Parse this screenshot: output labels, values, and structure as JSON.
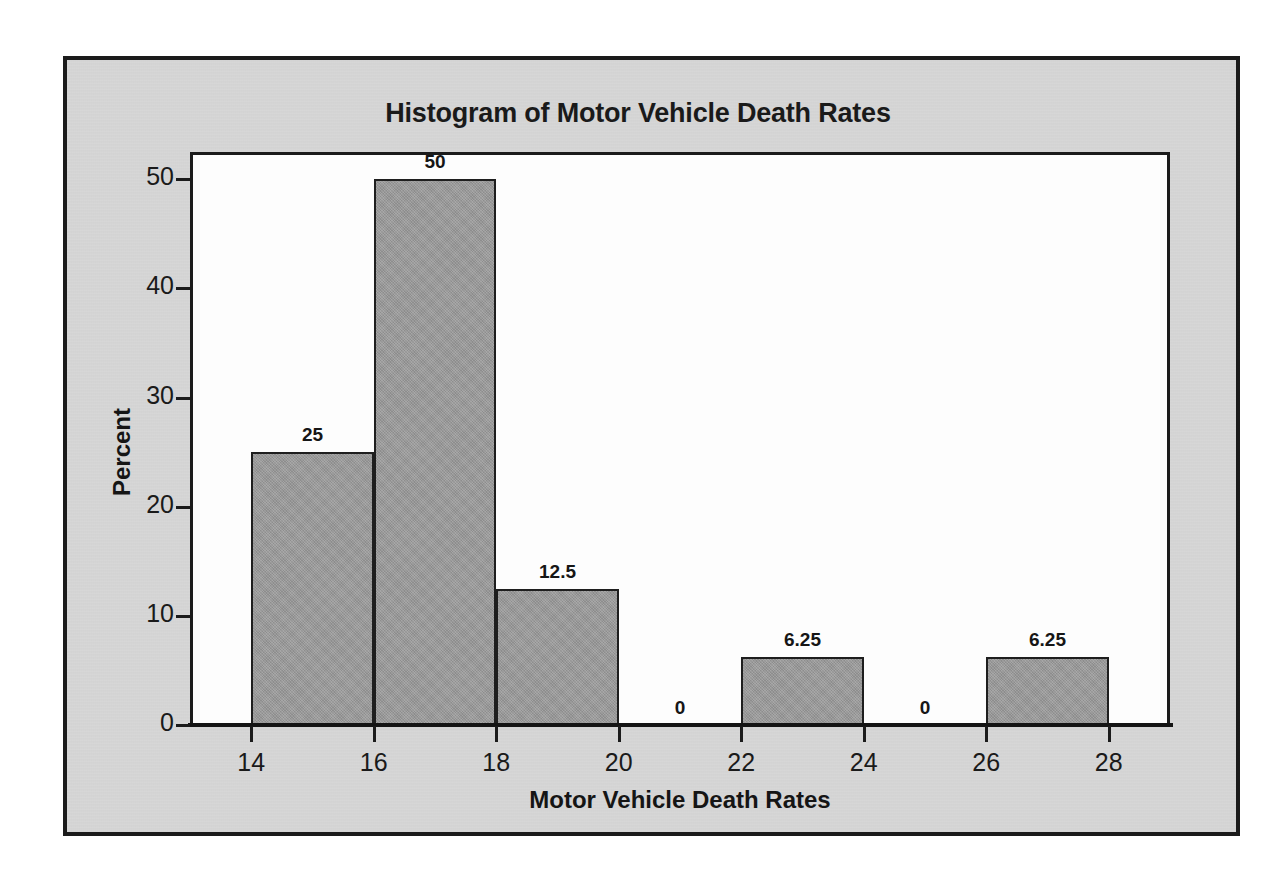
{
  "figure": {
    "title": "Histogram of Motor Vehicle Death Rates",
    "frame_color": "#1b1b1b",
    "panel_color": "#d7d7d7",
    "plot_background": "#fdfdfd",
    "bar_fill": "#9b9b9b",
    "bar_outline": "#1e1e1e"
  },
  "ghost_text": {
    "title": "Relative Frequency Histogram of",
    "line1": "Variables",
    "line2": "Relative Frequency",
    "line3": "Cumulative Frequency"
  },
  "chart_data": {
    "type": "bar",
    "title": "Histogram of Motor Vehicle Death Rates",
    "xlabel": "Motor Vehicle Death Rates",
    "ylabel": "Percent",
    "grid": false,
    "legend": false,
    "xlim": [
      13,
      29
    ],
    "ylim": [
      0,
      52.5
    ],
    "x_ticks": [
      14,
      16,
      18,
      20,
      22,
      24,
      26,
      28
    ],
    "x_tick_labels": [
      "14",
      "16",
      "18",
      "20",
      "22",
      "24",
      "26",
      "28"
    ],
    "y_ticks": [
      0,
      10,
      20,
      30,
      40,
      50
    ],
    "y_tick_labels": [
      "0",
      "10",
      "20",
      "30",
      "40",
      "50"
    ],
    "bin_width": 2,
    "bins": [
      {
        "bin_start": 14,
        "bin_end": 16,
        "value": 25,
        "label": "25"
      },
      {
        "bin_start": 16,
        "bin_end": 18,
        "value": 50,
        "label": "50"
      },
      {
        "bin_start": 18,
        "bin_end": 20,
        "value": 12.5,
        "label": "12.5"
      },
      {
        "bin_start": 20,
        "bin_end": 22,
        "value": 0,
        "label": "0"
      },
      {
        "bin_start": 22,
        "bin_end": 24,
        "value": 6.25,
        "label": "6.25"
      },
      {
        "bin_start": 24,
        "bin_end": 26,
        "value": 0,
        "label": "0"
      },
      {
        "bin_start": 26,
        "bin_end": 28,
        "value": 6.25,
        "label": "6.25"
      }
    ],
    "categories": [
      "14-16",
      "16-18",
      "18-20",
      "20-22",
      "22-24",
      "24-26",
      "26-28"
    ],
    "values": [
      25,
      50,
      12.5,
      0,
      6.25,
      0,
      6.25
    ]
  }
}
